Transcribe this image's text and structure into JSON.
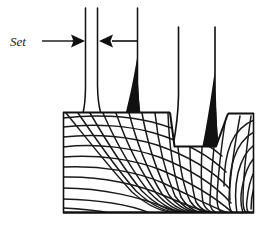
{
  "figure": {
    "background_color": "#ffffff",
    "ink_color": "#101010",
    "wood_fill_color": "#ffffff",
    "sawdust_fill_color": "#111111",
    "width": 265,
    "height": 225
  },
  "annotations": {
    "set_label": "Set",
    "set_label_style": "italic-serif",
    "leader_line": {
      "from_x": 42,
      "to_x": 70,
      "y": 41
    },
    "dimension": {
      "left_arrow_points_right": true,
      "right_arrow_points_left": true,
      "left_arrow_tip_x": 85,
      "right_arrow_tip_x": 97,
      "arrow_y": 41,
      "right_tail_x": 137
    }
  },
  "saw_teeth": [
    {
      "id": "tooth-1",
      "x": 85,
      "top_y": 8,
      "base_y": 112,
      "has_sawdust_wedge": false
    },
    {
      "id": "tooth-2",
      "x": 97,
      "top_y": 8,
      "base_y": 112,
      "has_sawdust_wedge": false
    },
    {
      "id": "tooth-3",
      "x": 137,
      "top_y": 8,
      "base_y": 112,
      "has_sawdust_wedge": true
    },
    {
      "id": "tooth-4",
      "x": 178,
      "top_y": 27,
      "base_y": 146,
      "has_sawdust_wedge": false
    },
    {
      "id": "tooth-5",
      "x": 215,
      "top_y": 27,
      "base_y": 146,
      "has_sawdust_wedge": true
    }
  ],
  "workpiece": {
    "name": "wood-block",
    "left_x": 63,
    "right_x": 254,
    "top_y": 112,
    "bottom_y": 213,
    "grain_description": "curved annual growth rings crossed by radial rays",
    "kerf": {
      "name": "saw-kerf-groove",
      "left_x": 170,
      "right_x": 228,
      "top_y": 112,
      "bottom_y": 146,
      "description": "groove cut by saw blade into the wood surface"
    }
  },
  "legend": {
    "set_meaning": "lateral offset of saw tooth from blade plane"
  }
}
